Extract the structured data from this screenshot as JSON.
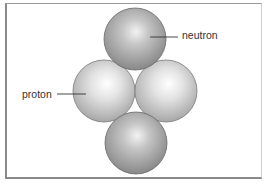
{
  "diagram": {
    "type": "atomic-nucleus",
    "labels": {
      "neutron": "neutron",
      "proton": "proton"
    },
    "particles": [
      {
        "kind": "neutron",
        "cx": 135,
        "cy": 39,
        "r": 31
      },
      {
        "kind": "proton",
        "cx": 104,
        "cy": 91,
        "r": 31
      },
      {
        "kind": "proton",
        "cx": 166,
        "cy": 91,
        "r": 31
      },
      {
        "kind": "neutron",
        "cx": 135,
        "cy": 143,
        "r": 31
      }
    ],
    "colors": {
      "neutron_light": "#d8d8d8",
      "neutron_dark": "#8c8c8c",
      "proton_light": "#ffffff",
      "proton_dark": "#a8a8a8",
      "leader_line": "#333333"
    }
  }
}
